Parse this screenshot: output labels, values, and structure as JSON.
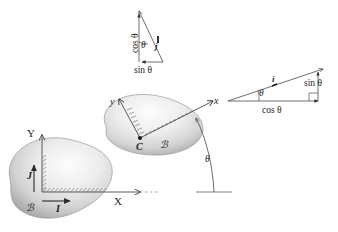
{
  "figure": {
    "colors": {
      "ink": "#1c1c1c",
      "line": "#4a4a4a",
      "blob_light": "#f3f3f3",
      "blob_mid": "#d8d8d8",
      "blob_dark": "#a8a8a8",
      "background": "#ffffff"
    }
  },
  "reference_frame": {
    "axis_x_label": "X",
    "axis_y_label": "Y",
    "unit_vector_i": "I",
    "unit_vector_j": "J",
    "body_label": "ℬ"
  },
  "body_frame": {
    "axis_x_label": "x",
    "axis_y_label": "y",
    "center_label": "C",
    "body_label": "ℬ",
    "rotation_angle_label": "θ"
  },
  "triangle_i": {
    "hypotenuse_label": "i",
    "vertical_label": "sin θ",
    "horizontal_label": "cos θ",
    "angle_label": "θ"
  },
  "triangle_j": {
    "hypotenuse_label": "j",
    "vertical_label": "cos θ",
    "horizontal_label": "sin θ",
    "angle_label": "θ"
  }
}
